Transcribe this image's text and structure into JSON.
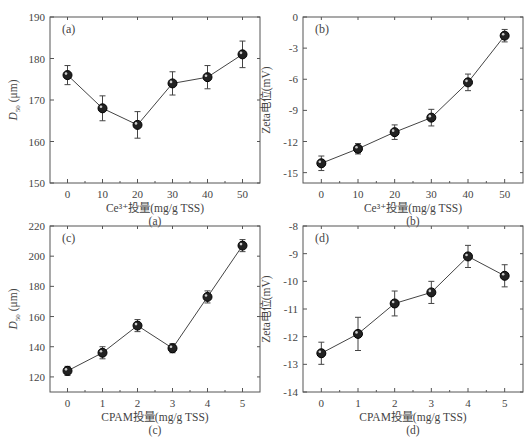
{
  "chart_data": [
    {
      "id": "a",
      "type": "line",
      "panel_label": "(a)",
      "caption": "(a)",
      "xlabel": "Ce³⁺投量(mg/g TSS)",
      "ylabel": "D50 (μm)",
      "x": [
        0,
        10,
        20,
        30,
        40,
        50
      ],
      "values": [
        176,
        168,
        164,
        174,
        175.5,
        181
      ],
      "errors": [
        2.3,
        3.0,
        3.2,
        2.8,
        2.8,
        3.2
      ],
      "xticks": [
        0,
        10,
        20,
        30,
        40,
        50
      ],
      "yticks": [
        150,
        160,
        170,
        180,
        190
      ],
      "xlim": [
        -5,
        55
      ],
      "ylim": [
        150,
        190
      ],
      "grid": false
    },
    {
      "id": "b",
      "type": "line",
      "panel_label": "(b)",
      "caption": "(b)",
      "xlabel": "Ce³⁺投量(mg/g TSS)",
      "ylabel": "Zeta电位(mV)",
      "x": [
        0,
        10,
        20,
        30,
        40,
        50
      ],
      "values": [
        -14.1,
        -12.7,
        -11.1,
        -9.7,
        -6.3,
        -1.8
      ],
      "errors": [
        0.7,
        0.5,
        0.7,
        0.8,
        0.8,
        0.6
      ],
      "xticks": [
        0,
        10,
        20,
        30,
        40,
        50
      ],
      "yticks": [
        -15,
        -12,
        -9,
        -6,
        -3,
        0
      ],
      "xlim": [
        -5,
        55
      ],
      "ylim": [
        -16,
        0
      ],
      "grid": false
    },
    {
      "id": "c",
      "type": "line",
      "panel_label": "(c)",
      "caption": "(c)",
      "xlabel": "CPAM投量(mg/g TSS)",
      "ylabel": "D50 (μm)",
      "x": [
        0,
        1,
        2,
        3,
        4,
        5
      ],
      "values": [
        124,
        136,
        154,
        139,
        173,
        207
      ],
      "errors": [
        3,
        4,
        4,
        3,
        4,
        4
      ],
      "xticks": [
        0,
        1,
        2,
        3,
        4,
        5
      ],
      "yticks": [
        120,
        140,
        160,
        180,
        200,
        220
      ],
      "xlim": [
        -0.5,
        5.5
      ],
      "ylim": [
        110,
        220
      ],
      "grid": false
    },
    {
      "id": "d",
      "type": "line",
      "panel_label": "(d)",
      "caption": "(d)",
      "xlabel": "CPAM投量(mg/g TSS)",
      "ylabel": "Zeta电位(mV)",
      "x": [
        0,
        1,
        2,
        3,
        4,
        5
      ],
      "values": [
        -12.6,
        -11.9,
        -10.8,
        -10.4,
        -9.1,
        -9.8
      ],
      "errors": [
        0.4,
        0.6,
        0.45,
        0.4,
        0.4,
        0.4
      ],
      "xticks": [
        0,
        1,
        2,
        3,
        4,
        5
      ],
      "yticks": [
        -14,
        -13,
        -12,
        -11,
        -10,
        -9,
        -8
      ],
      "xlim": [
        -0.5,
        5.5
      ],
      "ylim": [
        -14,
        -8
      ],
      "grid": false
    }
  ],
  "layout": {
    "panels": [
      {
        "left": 50,
        "top": 17,
        "width": 210,
        "height": 166
      },
      {
        "left": 303,
        "top": 17,
        "width": 220,
        "height": 166
      },
      {
        "left": 50,
        "top": 226,
        "width": 210,
        "height": 166
      },
      {
        "left": 303,
        "top": 226,
        "width": 220,
        "height": 166
      }
    ],
    "axis_color": "#555555",
    "line_color": "#444444",
    "marker_color": "#222222"
  }
}
